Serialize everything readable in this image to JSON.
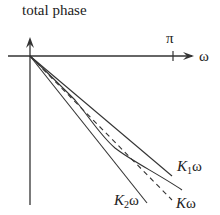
{
  "diagram": {
    "title": "total phase",
    "x_axis_label": "ω",
    "pi_tick_label": "π",
    "lines": [
      {
        "id": "K1",
        "label_prefix": "K",
        "label_sub": "1",
        "label_suffix": "ω",
        "style": "solid"
      },
      {
        "id": "K2",
        "label_prefix": "K",
        "label_sub": "2",
        "label_suffix": "ω",
        "style": "solid"
      },
      {
        "id": "K",
        "label_prefix": "K",
        "label_suffix": "ω",
        "style": "dashed"
      }
    ],
    "curve": {
      "name": "total phase curve",
      "style": "solid"
    },
    "colors": {
      "stroke": "#333333",
      "background": "#ffffff"
    }
  }
}
